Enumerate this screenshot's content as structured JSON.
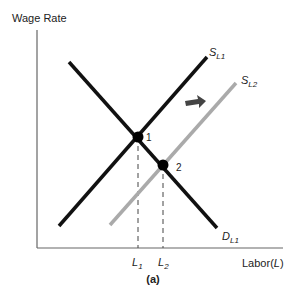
{
  "diagram": {
    "y_axis_label": "Wage Rate",
    "x_axis_label_prefix": "Labor(",
    "x_axis_label_var": "L",
    "x_axis_label_suffix": ")",
    "caption": "(a)",
    "curves": {
      "supply1": {
        "main": "S",
        "sub": "L1",
        "color": "#111111"
      },
      "supply2": {
        "main": "S",
        "sub": "L2",
        "color": "#aaaaaa"
      },
      "demand1": {
        "main": "D",
        "sub": "L1",
        "color": "#111111"
      }
    },
    "points": [
      {
        "label": "1"
      },
      {
        "label": "2"
      }
    ],
    "ticks": [
      {
        "main": "L",
        "sub": "1"
      },
      {
        "main": "L",
        "sub": "2"
      }
    ],
    "shift_arrow": {
      "direction": "right",
      "color": "#444444"
    }
  }
}
